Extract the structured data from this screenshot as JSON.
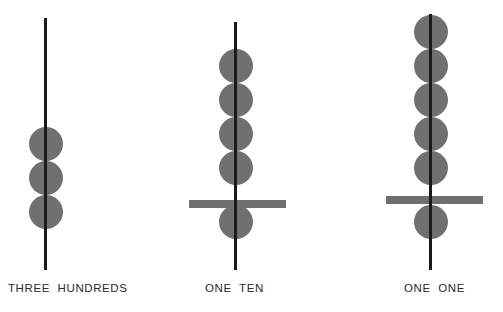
{
  "figure": {
    "background_color": "#ffffff",
    "bead_color": "#707070",
    "spindle_color": "#1a1a1a",
    "crossbar_color": "#707070",
    "label_color": "#2b2b2b",
    "width": 503,
    "height": 312
  },
  "groups": [
    {
      "id": "group-hundreds",
      "label": "THREE  HUNDREDS",
      "label_x": 8,
      "label_y": 283,
      "spindle": {
        "x": 44,
        "y": 18,
        "width": 3,
        "height": 252
      },
      "crossbar": null,
      "bead_count": 3,
      "beads_above_bar": 3,
      "beads_below_bar": 0,
      "bead_diameter": 34,
      "bead_center_x": 46,
      "bead_centers_y": [
        144,
        178,
        212
      ]
    },
    {
      "id": "group-tens",
      "label": "ONE  TEN",
      "label_x": 205,
      "label_y": 283,
      "spindle": {
        "x": 234,
        "y": 22,
        "width": 3,
        "height": 248
      },
      "crossbar": {
        "x": 189,
        "y": 200,
        "width": 97,
        "height": 8
      },
      "bead_count": 5,
      "beads_above_bar": 4,
      "beads_below_bar": 1,
      "bead_diameter": 34,
      "bead_center_x": 236,
      "bead_centers_y": [
        66,
        100,
        134,
        168,
        222
      ]
    },
    {
      "id": "group-ones",
      "label": "ONE  ONE",
      "label_x": 404,
      "label_y": 283,
      "spindle": {
        "x": 429,
        "y": 14,
        "width": 3,
        "height": 256
      },
      "crossbar": {
        "x": 386,
        "y": 196,
        "width": 97,
        "height": 8
      },
      "bead_count": 6,
      "beads_above_bar": 5,
      "beads_below_bar": 1,
      "bead_diameter": 34,
      "bead_center_x": 431,
      "bead_centers_y": [
        32,
        66,
        100,
        134,
        168,
        222
      ]
    }
  ]
}
